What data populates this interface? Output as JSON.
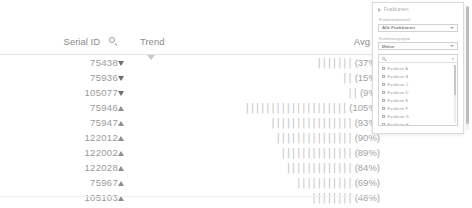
{
  "table": {
    "columns": [
      {
        "key": "serial",
        "label": "Serial ID",
        "icon": "search-icon"
      },
      {
        "key": "trend",
        "label": "Trend"
      },
      {
        "key": "avg",
        "label": "Avg"
      }
    ],
    "rows": [
      {
        "serial": "75438",
        "trend": "down",
        "bars": "|||||||",
        "pct": "(37%)",
        "value": 37
      },
      {
        "serial": "75936",
        "trend": "down",
        "bars": "||",
        "pct": "(15%)",
        "value": 15
      },
      {
        "serial": "105077",
        "trend": "down",
        "bars": "||",
        "pct": "(9%)",
        "value": 9
      },
      {
        "serial": "75946",
        "trend": "up",
        "bars": "||||||||||||||||||||",
        "pct": "(105%)",
        "value": 105
      },
      {
        "serial": "75947",
        "trend": "up",
        "bars": "||||||||||||||||",
        "pct": "(93%)",
        "value": 93
      },
      {
        "serial": "122012",
        "trend": "up",
        "bars": "|||||||||||||||",
        "pct": "(90%)",
        "value": 90
      },
      {
        "serial": "122002",
        "trend": "up",
        "bars": "||||||||||||||",
        "pct": "(89%)",
        "value": 89
      },
      {
        "serial": "122028",
        "trend": "up",
        "bars": "|||||||||||||",
        "pct": "(84%)",
        "value": 84
      },
      {
        "serial": "75967",
        "trend": "up",
        "bars": "|||||||||||",
        "pct": "(69%)",
        "value": 69
      },
      {
        "serial": "105103",
        "trend": "up",
        "bars": "||||||||",
        "pct": "(48%)",
        "value": 48
      }
    ]
  },
  "filter_panel": {
    "title": "Funktionen",
    "fields": [
      {
        "label": "Funktionsbereich",
        "value": "Alle Funktionen"
      },
      {
        "label": "Funktionsgruppe",
        "value": "Meine"
      }
    ],
    "search": {
      "value": ""
    },
    "items": [
      {
        "label": "Funktion A"
      },
      {
        "label": "Funktion B"
      },
      {
        "label": "Funktion C"
      },
      {
        "label": "Funktion D"
      },
      {
        "label": "Funktion E"
      },
      {
        "label": "Funktion F"
      },
      {
        "label": "Funktion G"
      },
      {
        "label": "Funktion H"
      }
    ]
  }
}
